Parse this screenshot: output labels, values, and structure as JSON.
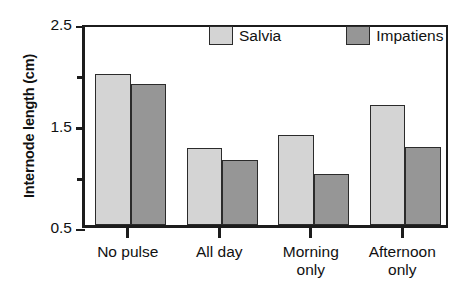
{
  "chart_data": {
    "type": "bar",
    "title": "",
    "subtitle": "",
    "xlabel": "",
    "ylabel": "Internode length (cm)",
    "categories": [
      "No pulse",
      "All day",
      "Morning\nonly",
      "Afternoon\nonly"
    ],
    "series": [
      {
        "name": "Salvia",
        "color": "#d4d4d4",
        "values": [
          2.03,
          1.28,
          1.41,
          1.71
        ]
      },
      {
        "name": "Impatiens",
        "color": "#969696",
        "values": [
          1.92,
          1.16,
          1.02,
          1.29
        ]
      }
    ],
    "ylim": [
      0.5,
      2.5
    ],
    "ytick_major": [
      "2.5",
      "1.5",
      "0.5"
    ],
    "ytick_major_values": [
      2.5,
      1.5,
      0.5
    ],
    "ytick_minor_values": [
      2.0,
      1.0
    ],
    "grid": false,
    "legend_position": "top-center",
    "frame": true
  },
  "legend": {
    "entries": [
      {
        "label": "Salvia",
        "color": "#d4d4d4"
      },
      {
        "label": "Impatiens",
        "color": "#969696"
      }
    ]
  },
  "axes": {
    "y_title": "Internode length (cm)"
  }
}
